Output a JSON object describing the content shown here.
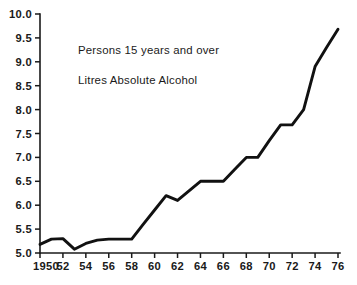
{
  "chart_data": {
    "type": "line",
    "title": "",
    "annotations": [
      "Persons 15 years and over",
      "Litres Absolute Alcohol"
    ],
    "xlabel": "",
    "ylabel": "",
    "xlim": [
      1950,
      1976
    ],
    "ylim": [
      5.0,
      10.0
    ],
    "grid": false,
    "legend": false,
    "y_ticks": [
      "10.0",
      "9.5",
      "9.0",
      "8.5",
      "8.0",
      "7.5",
      "7.0",
      "6.5",
      "6.0",
      "5.5",
      "5.0"
    ],
    "y_tick_values": [
      10.0,
      9.5,
      9.0,
      8.5,
      8.0,
      7.5,
      7.0,
      6.5,
      6.0,
      5.5,
      5.0
    ],
    "x_ticks": [
      "1950",
      "52",
      "54",
      "56",
      "58",
      "60",
      "62",
      "64",
      "66",
      "68",
      "70",
      "72",
      "74",
      "76"
    ],
    "x_tick_values": [
      1950,
      1952,
      1954,
      1956,
      1958,
      1960,
      1962,
      1964,
      1966,
      1968,
      1970,
      1972,
      1974,
      1976
    ],
    "x": [
      1950,
      1951,
      1952,
      1953,
      1954,
      1955,
      1956,
      1957,
      1958,
      1959,
      1960,
      1961,
      1962,
      1963,
      1964,
      1965,
      1966,
      1967,
      1968,
      1969,
      1970,
      1971,
      1972,
      1973,
      1974,
      1975,
      1976
    ],
    "values": [
      5.18,
      5.29,
      5.3,
      5.08,
      5.2,
      5.27,
      5.29,
      5.29,
      5.29,
      5.6,
      5.9,
      6.2,
      6.1,
      6.3,
      6.5,
      6.5,
      6.5,
      6.75,
      7.0,
      7.0,
      7.35,
      7.68,
      7.68,
      8.0,
      8.9,
      9.3,
      9.68
    ],
    "series": [
      {
        "name": "Litres Absolute Alcohol",
        "color": "#111111",
        "values": [
          5.18,
          5.29,
          5.3,
          5.08,
          5.2,
          5.27,
          5.29,
          5.29,
          5.29,
          5.6,
          5.9,
          6.2,
          6.1,
          6.3,
          6.5,
          6.5,
          6.5,
          6.75,
          7.0,
          7.0,
          7.35,
          7.68,
          7.68,
          8.0,
          8.9,
          9.3,
          9.68
        ]
      }
    ]
  },
  "geometry": {
    "plot_left": 40,
    "plot_right": 338,
    "plot_top": 14,
    "plot_bottom": 253
  },
  "colors": {
    "line": "#111111",
    "axis": "#1a1a1a",
    "text": "#1a1a1a",
    "background": "#ffffff"
  }
}
